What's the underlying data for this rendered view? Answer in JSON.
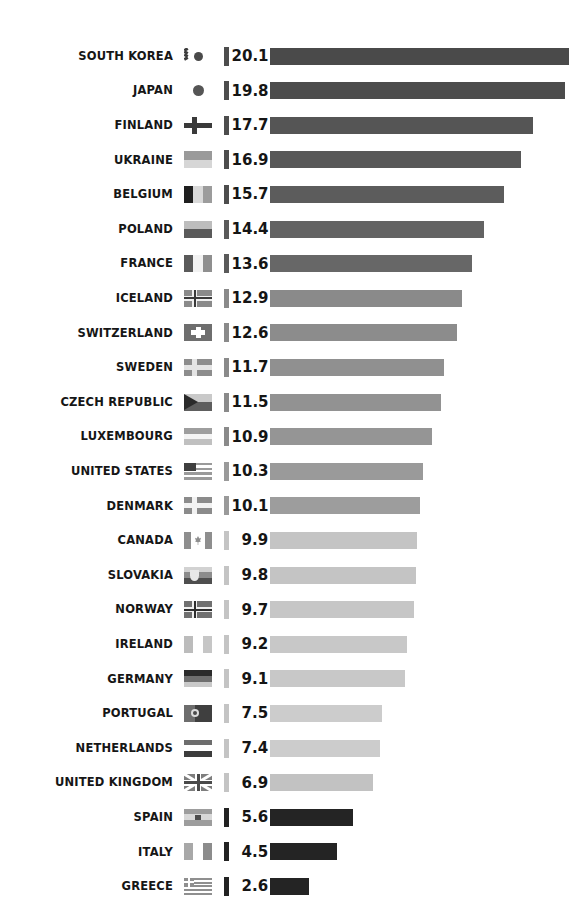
{
  "chart_data": {
    "type": "bar",
    "title": "",
    "subtitle": "",
    "xlabel": "",
    "ylabel": "",
    "orientation": "horizontal",
    "grid": false,
    "legend": false,
    "xlim": [
      0,
      20.1
    ],
    "categories": [
      "SOUTH KOREA",
      "JAPAN",
      "FINLAND",
      "UKRAINE",
      "BELGIUM",
      "POLAND",
      "FRANCE",
      "ICELAND",
      "SWITZERLAND",
      "SWEDEN",
      "CZECH REPUBLIC",
      "LUXEMBOURG",
      "UNITED STATES",
      "DENMARK",
      "CANADA",
      "SLOVAKIA",
      "NORWAY",
      "IRELAND",
      "GERMANY",
      "PORTUGAL",
      "NETHERLANDS",
      "UNITED KINGDOM",
      "SPAIN",
      "ITALY",
      "GREECE"
    ],
    "values": [
      20.1,
      19.8,
      17.7,
      16.9,
      15.7,
      14.4,
      13.6,
      12.9,
      12.6,
      11.7,
      11.5,
      10.9,
      10.3,
      10.1,
      9.9,
      9.8,
      9.7,
      9.2,
      9.1,
      7.5,
      7.4,
      6.9,
      5.6,
      4.5,
      2.6
    ],
    "value_labels": [
      "20.1",
      "19.8",
      "17.7",
      "16.9",
      "15.7",
      "14.4",
      "13.6",
      "12.9",
      "12.6",
      "11.7",
      "11.5",
      "10.9",
      "10.3",
      "10.1",
      "9.9",
      "9.8",
      "9.7",
      "9.2",
      "9.1",
      "7.5",
      "7.4",
      "6.9",
      "5.6",
      "4.5",
      "2.6"
    ]
  },
  "colors": {
    "background": "#ffffff",
    "bar_dark": "#4d4d4d",
    "bar_mid": "#808080",
    "bar_light": "#c3c3c3",
    "bar_black": "#222222",
    "label_text": "#161616",
    "value_text": "#151515"
  },
  "rows": [
    {
      "country": "SOUTH KOREA",
      "value_label": "20.1",
      "value": 20.1,
      "bar_color": "#4a4a4a",
      "tick_color": "#4d4d4d",
      "flag": "south-korea-flag"
    },
    {
      "country": "JAPAN",
      "value_label": "19.8",
      "value": 19.8,
      "bar_color": "#4c4c4c",
      "tick_color": "#4d4d4d",
      "flag": "japan-flag"
    },
    {
      "country": "FINLAND",
      "value_label": "17.7",
      "value": 17.7,
      "bar_color": "#555555",
      "tick_color": "#4d4d4d",
      "flag": "finland-flag"
    },
    {
      "country": "UKRAINE",
      "value_label": "16.9",
      "value": 16.9,
      "bar_color": "#585858",
      "tick_color": "#4d4d4d",
      "flag": "ukraine-flag"
    },
    {
      "country": "BELGIUM",
      "value_label": "15.7",
      "value": 15.7,
      "bar_color": "#5c5c5c",
      "tick_color": "#4d4d4d",
      "flag": "belgium-flag"
    },
    {
      "country": "POLAND",
      "value_label": "14.4",
      "value": 14.4,
      "bar_color": "#636363",
      "tick_color": "#5a5a5a",
      "flag": "poland-flag"
    },
    {
      "country": "FRANCE",
      "value_label": "13.6",
      "value": 13.6,
      "bar_color": "#676767",
      "tick_color": "#5a5a5a",
      "flag": "france-flag"
    },
    {
      "country": "ICELAND",
      "value_label": "12.9",
      "value": 12.9,
      "bar_color": "#8a8a8a",
      "tick_color": "#8a8a8a",
      "flag": "iceland-flag"
    },
    {
      "country": "SWITZERLAND",
      "value_label": "12.6",
      "value": 12.6,
      "bar_color": "#8c8c8c",
      "tick_color": "#8a8a8a",
      "flag": "switzerland-flag"
    },
    {
      "country": "SWEDEN",
      "value_label": "11.7",
      "value": 11.7,
      "bar_color": "#909090",
      "tick_color": "#8a8a8a",
      "flag": "sweden-flag"
    },
    {
      "country": "CZECH REPUBLIC",
      "value_label": "11.5",
      "value": 11.5,
      "bar_color": "#929292",
      "tick_color": "#8a8a8a",
      "flag": "czech-republic-flag"
    },
    {
      "country": "LUXEMBOURG",
      "value_label": "10.9",
      "value": 10.9,
      "bar_color": "#959595",
      "tick_color": "#8a8a8a",
      "flag": "luxembourg-flag"
    },
    {
      "country": "UNITED STATES",
      "value_label": "10.3",
      "value": 10.3,
      "bar_color": "#9a9a9a",
      "tick_color": "#9a9a9a",
      "flag": "united-states-flag"
    },
    {
      "country": "DENMARK",
      "value_label": "10.1",
      "value": 10.1,
      "bar_color": "#9d9d9d",
      "tick_color": "#9a9a9a",
      "flag": "denmark-flag"
    },
    {
      "country": "CANADA",
      "value_label": "9.9",
      "value": 9.9,
      "bar_color": "#c4c4c4",
      "tick_color": "#c4c4c4",
      "flag": "canada-flag"
    },
    {
      "country": "SLOVAKIA",
      "value_label": "9.8",
      "value": 9.8,
      "bar_color": "#c4c4c4",
      "tick_color": "#c4c4c4",
      "flag": "slovakia-flag"
    },
    {
      "country": "NORWAY",
      "value_label": "9.7",
      "value": 9.7,
      "bar_color": "#c6c6c6",
      "tick_color": "#c4c4c4",
      "flag": "norway-flag"
    },
    {
      "country": "IRELAND",
      "value_label": "9.2",
      "value": 9.2,
      "bar_color": "#c8c8c8",
      "tick_color": "#c4c4c4",
      "flag": "ireland-flag"
    },
    {
      "country": "GERMANY",
      "value_label": "9.1",
      "value": 9.1,
      "bar_color": "#c8c8c8",
      "tick_color": "#c4c4c4",
      "flag": "germany-flag"
    },
    {
      "country": "PORTUGAL",
      "value_label": "7.5",
      "value": 7.5,
      "bar_color": "#cccccc",
      "tick_color": "#c4c4c4",
      "flag": "portugal-flag"
    },
    {
      "country": "NETHERLANDS",
      "value_label": "7.4",
      "value": 7.4,
      "bar_color": "#cccccc",
      "tick_color": "#c4c4c4",
      "flag": "netherlands-flag"
    },
    {
      "country": "UNITED KINGDOM",
      "value_label": "6.9",
      "value": 6.9,
      "bar_color": "#c2c2c2",
      "tick_color": "#c4c4c4",
      "flag": "united-kingdom-flag"
    },
    {
      "country": "SPAIN",
      "value_label": "5.6",
      "value": 5.6,
      "bar_color": "#242424",
      "tick_color": "#222222",
      "flag": "spain-flag"
    },
    {
      "country": "ITALY",
      "value_label": "4.5",
      "value": 4.5,
      "bar_color": "#242424",
      "tick_color": "#222222",
      "flag": "italy-flag"
    },
    {
      "country": "GREECE",
      "value_label": "2.6",
      "value": 2.6,
      "bar_color": "#242424",
      "tick_color": "#222222",
      "flag": "greece-flag"
    }
  ],
  "layout": {
    "first_row_top": 43,
    "row_step": 34.6,
    "bar_origin_x": 262,
    "px_per_unit": 14.88
  }
}
